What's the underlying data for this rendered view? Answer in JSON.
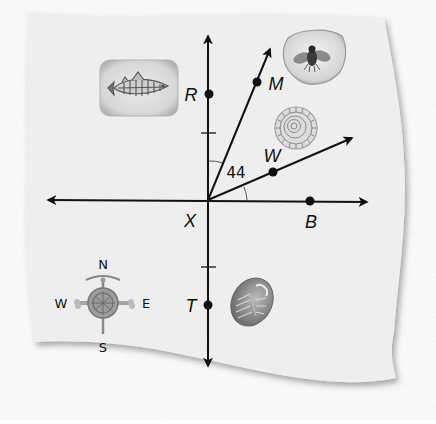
{
  "figure": {
    "type": "geometry-map-diagram",
    "background_paper_color": "#f2f2f2",
    "line_color": "#111111"
  },
  "points": {
    "X": {
      "label": "X",
      "x": 208,
      "y": 200
    },
    "R": {
      "label": "R",
      "x": 209,
      "y": 94
    },
    "M": {
      "label": "M",
      "x": 257,
      "y": 82
    },
    "W": {
      "label": "W",
      "x": 273,
      "y": 172
    },
    "B": {
      "label": "B",
      "x": 310,
      "y": 201
    },
    "T": {
      "label": "T",
      "x": 208,
      "y": 305
    }
  },
  "angle": {
    "label": "44",
    "between": [
      "XR",
      "XM"
    ],
    "note": "arc marks between ray XR and ray XM, and between ray XW and ray XB"
  },
  "lines": [
    {
      "name": "vertical-line-RT",
      "description": "line through R, X, T with arrows both ends"
    },
    {
      "name": "horizontal-line-XB",
      "description": "line through X and B with arrows both ends"
    },
    {
      "name": "ray-XM",
      "description": "ray from X through M"
    },
    {
      "name": "ray-XW",
      "description": "ray from X through W"
    }
  ],
  "compass": {
    "north": "N",
    "south": "S",
    "east": "E",
    "west": "W"
  },
  "illustrations": [
    {
      "name": "fish-fossil",
      "description": "fish fossil in stone slab"
    },
    {
      "name": "insect-in-amber",
      "description": "fly preserved in amber"
    },
    {
      "name": "ammonite-fossil",
      "description": "spiral ammonite shell"
    },
    {
      "name": "trilobite-fossil",
      "description": "trilobite fossil"
    }
  ]
}
